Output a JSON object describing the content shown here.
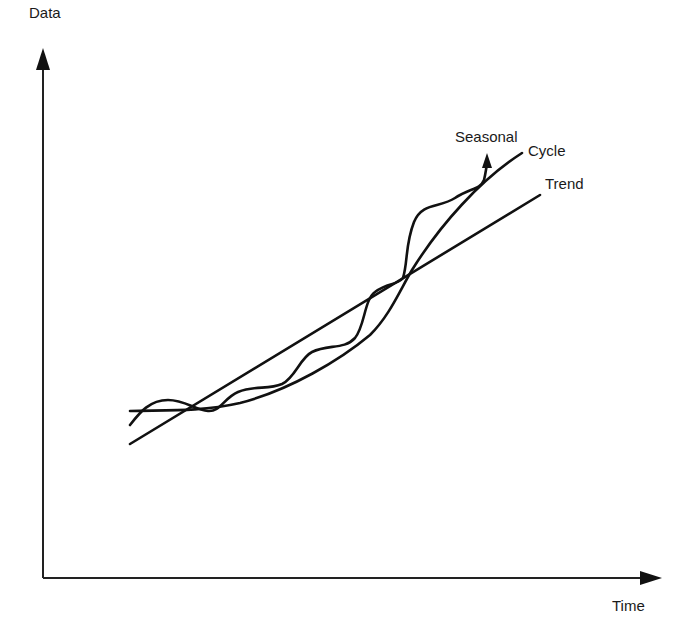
{
  "diagram": {
    "type": "time-series-components",
    "axes": {
      "y_label": "Data",
      "x_label": "Time"
    },
    "components": [
      {
        "name": "Seasonal",
        "description": "oscillating curve around the cycle, ending with an arrow"
      },
      {
        "name": "Cycle",
        "description": "upward-curving smooth line"
      },
      {
        "name": "Trend",
        "description": "straight rising line"
      }
    ],
    "labels": {
      "seasonal": "Seasonal",
      "cycle": "Cycle",
      "trend": "Trend"
    },
    "colors": {
      "line": "#111111",
      "background": "#ffffff",
      "text": "#1a1a1a"
    }
  }
}
